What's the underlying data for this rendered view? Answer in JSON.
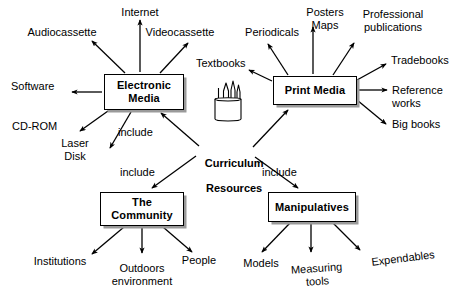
{
  "diagram": {
    "title": "Curriculum Resources",
    "type": "concept-map",
    "center": {
      "label_line1": "Curriculum",
      "label_line2": "Resources",
      "icon": "pencil-cup-icon"
    },
    "link_labels": [
      {
        "text": "include",
        "x": 118,
        "y": 126
      },
      {
        "text": "include",
        "x": 120,
        "y": 166
      },
      {
        "text": "include",
        "x": 262,
        "y": 166
      }
    ],
    "nodes": [
      {
        "id": "electronic-media",
        "label": "Electronic\nMedia",
        "x": 104,
        "y": 74,
        "w": 80,
        "h": 36,
        "leaves": [
          {
            "text": "Internet",
            "x": 110,
            "y": 6,
            "w": 60,
            "align": "center",
            "tilt": ""
          },
          {
            "text": "Audiocassette",
            "x": 22,
            "y": 26,
            "w": 80,
            "align": "center",
            "tilt": ""
          },
          {
            "text": "Videocassette",
            "x": 140,
            "y": 26,
            "w": 80,
            "align": "center",
            "tilt": ""
          },
          {
            "text": "Software",
            "x": 11,
            "y": 80,
            "w": 56,
            "align": "left",
            "tilt": ""
          },
          {
            "text": "CD-ROM",
            "x": 12,
            "y": 120,
            "w": 56,
            "align": "left",
            "tilt": ""
          },
          {
            "text": "Laser\nDisk",
            "x": 55,
            "y": 137,
            "w": 40,
            "align": "center",
            "tilt": ""
          }
        ]
      },
      {
        "id": "print-media",
        "label": "Print Media",
        "x": 273,
        "y": 76,
        "w": 84,
        "h": 29,
        "leaves": [
          {
            "text": "Textbooks",
            "x": 196,
            "y": 57,
            "w": 60,
            "align": "left",
            "tilt": ""
          },
          {
            "text": "Periodicals",
            "x": 240,
            "y": 26,
            "w": 64,
            "align": "center",
            "tilt": ""
          },
          {
            "text": "Posters\nMaps",
            "x": 300,
            "y": 6,
            "w": 50,
            "align": "center",
            "tilt": ""
          },
          {
            "text": "Professional\npublications",
            "x": 354,
            "y": 8,
            "w": 72,
            "align": "center",
            "tilt": ""
          },
          {
            "text": "Tradebooks",
            "x": 391,
            "y": 54,
            "w": 68,
            "align": "left",
            "tilt": ""
          },
          {
            "text": "Reference\nworks",
            "x": 392,
            "y": 84,
            "w": 62,
            "align": "left",
            "tilt": ""
          },
          {
            "text": "Big books",
            "x": 392,
            "y": 118,
            "w": 62,
            "align": "left",
            "tilt": ""
          }
        ]
      },
      {
        "id": "the-community",
        "label": "The\nCommunity",
        "x": 100,
        "y": 192,
        "w": 84,
        "h": 34,
        "leaves": [
          {
            "text": "Institutions",
            "x": 27,
            "y": 255,
            "w": 66,
            "align": "center",
            "tilt": ""
          },
          {
            "text": "Outdoors\nenvironment",
            "x": 100,
            "y": 262,
            "w": 76,
            "align": "center",
            "tilt": ""
          },
          {
            "text": "People",
            "x": 176,
            "y": 254,
            "w": 46,
            "align": "center",
            "tilt": ""
          }
        ]
      },
      {
        "id": "manipulatives",
        "label": "Manipulatives",
        "x": 268,
        "y": 192,
        "w": 88,
        "h": 30,
        "leaves": [
          {
            "text": "Models",
            "x": 237,
            "y": 257,
            "w": 48,
            "align": "center",
            "tilt": ""
          },
          {
            "text": "Measuring\ntools",
            "x": 288,
            "y": 262,
            "w": 62,
            "align": "center",
            "tilt": "tilt-a"
          },
          {
            "text": "Expendables",
            "x": 367,
            "y": 252,
            "w": 74,
            "align": "center",
            "tilt": "tilt-b"
          }
        ]
      }
    ],
    "colors": {
      "stroke": "#000000",
      "fill": "#ffffff",
      "shadow": "#9a9a9a",
      "text": "#000000"
    }
  }
}
